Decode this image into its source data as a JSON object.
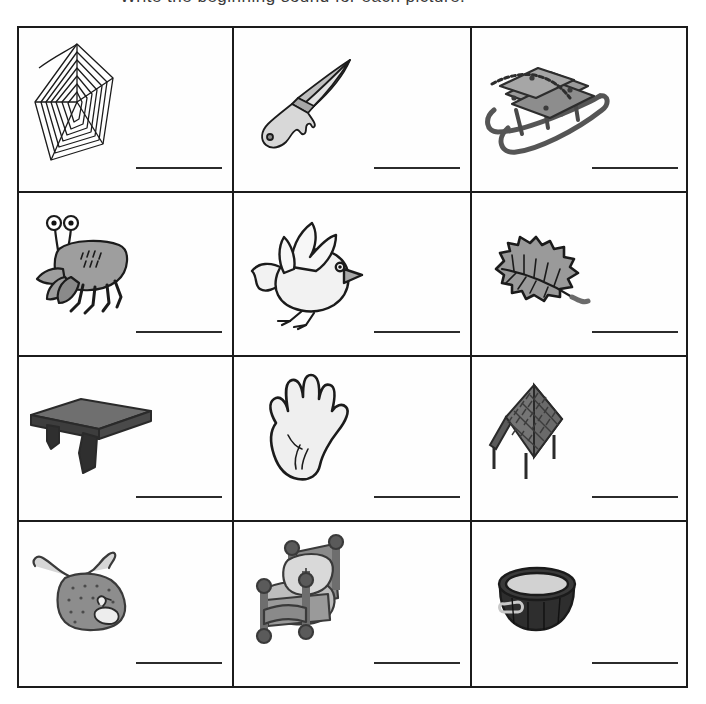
{
  "worksheet": {
    "title_remnant": "Write the beginning sound for each picture.",
    "ink_color": "#1b1b1b",
    "line_color": "#2b2b2b",
    "paper_color": "#ffffff",
    "grid": {
      "columns": 3,
      "rows": 4
    },
    "answer_line_label": "writing line",
    "cells": [
      {
        "index": 1,
        "picture": "spider-web",
        "label": "web",
        "answer_line": "_______"
      },
      {
        "index": 2,
        "picture": "knife",
        "label": "knife",
        "answer_line": "_______"
      },
      {
        "index": 3,
        "picture": "sled",
        "label": "sled",
        "answer_line": "_______"
      },
      {
        "index": 4,
        "picture": "crab",
        "label": "crab",
        "answer_line": "_______"
      },
      {
        "index": 5,
        "picture": "bird",
        "label": "bird",
        "answer_line": "_______"
      },
      {
        "index": 6,
        "picture": "leaf",
        "label": "leaf",
        "answer_line": "_______"
      },
      {
        "index": 7,
        "picture": "shelf",
        "label": "shelf",
        "answer_line": "_______"
      },
      {
        "index": 8,
        "picture": "hand",
        "label": "hand",
        "answer_line": "_______"
      },
      {
        "index": 9,
        "picture": "roof",
        "label": "roof",
        "answer_line": "_______"
      },
      {
        "index": 10,
        "picture": "bib",
        "label": "bib",
        "answer_line": "_______"
      },
      {
        "index": 11,
        "picture": "bed",
        "label": "bed",
        "answer_line": "_______"
      },
      {
        "index": 12,
        "picture": "tub",
        "label": "tub",
        "answer_line": "_______"
      }
    ]
  }
}
